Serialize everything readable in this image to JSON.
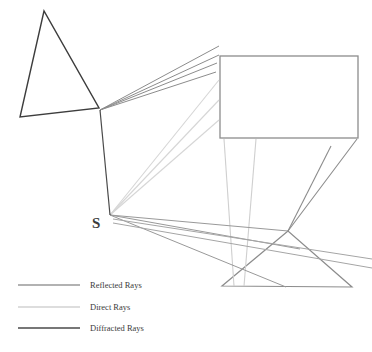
{
  "figure": {
    "type": "ray-propagation-diagram",
    "background": "#ffffff",
    "width": 372,
    "height": 352
  },
  "colors": {
    "reflected": "#8c8c8c",
    "direct": "#d6d6d6",
    "diffracted": "#4a4a4a",
    "obstacle_dark": "#3d3d3d",
    "obstacle_gray": "#8c8c8c",
    "label_text": "#3a3a3a"
  },
  "source": {
    "label": "S",
    "x": 110,
    "y": 215,
    "label_x": 92,
    "label_y": 228
  },
  "obstacles": [
    {
      "name": "left-triangle",
      "shape": "triangle",
      "stroke": "#3d3d3d",
      "stroke_width": 1.4,
      "points": "44,11 20,117 99,108"
    },
    {
      "name": "right-rectangle",
      "shape": "rectangle",
      "stroke": "#8c8c8c",
      "stroke_width": 1.3,
      "x": 220,
      "y": 56,
      "width": 138,
      "height": 82
    },
    {
      "name": "bottom-triangle",
      "shape": "triangle",
      "stroke": "#8c8c8c",
      "stroke_width": 1.2,
      "points": "288,231 222,286 352,287"
    }
  ],
  "ray_groups": [
    {
      "name": "diffracted-source-to-edge",
      "category": "diffracted",
      "stroke": "#4a4a4a",
      "stroke_width": 1.2,
      "segments": [
        {
          "x1": 110,
          "y1": 215,
          "x2": 100,
          "y2": 110
        }
      ]
    },
    {
      "name": "reflected-fan-upper-right",
      "category": "reflected",
      "stroke": "#8c8c8c",
      "stroke_width": 1.0,
      "segments": [
        {
          "x1": 100,
          "y1": 110,
          "x2": 219,
          "y2": 46
        },
        {
          "x1": 100,
          "y1": 110,
          "x2": 219,
          "y2": 55
        },
        {
          "x1": 100,
          "y1": 110,
          "x2": 217,
          "y2": 63
        },
        {
          "x1": 100,
          "y1": 110,
          "x2": 216,
          "y2": 72
        }
      ]
    },
    {
      "name": "direct-fan-to-rectangle",
      "category": "direct",
      "stroke": "#d6d6d6",
      "stroke_width": 1.1,
      "segments": [
        {
          "x1": 110,
          "y1": 215,
          "x2": 219,
          "y2": 80
        },
        {
          "x1": 110,
          "y1": 215,
          "x2": 219,
          "y2": 100
        },
        {
          "x1": 110,
          "y1": 215,
          "x2": 219,
          "y2": 120
        }
      ]
    },
    {
      "name": "direct-verticals-below-rectangle",
      "category": "direct",
      "stroke": "#cfcfcf",
      "stroke_width": 1.1,
      "segments": [
        {
          "x1": 224,
          "y1": 139,
          "x2": 234,
          "y2": 286
        },
        {
          "x1": 256,
          "y1": 139,
          "x2": 244,
          "y2": 286
        }
      ]
    },
    {
      "name": "reflected-fan-lower-right",
      "category": "reflected",
      "stroke": "#999999",
      "stroke_width": 1.0,
      "segments": [
        {
          "x1": 110,
          "y1": 215,
          "x2": 288,
          "y2": 231
        },
        {
          "x1": 110,
          "y1": 215,
          "x2": 300,
          "y2": 249
        },
        {
          "x1": 110,
          "y1": 215,
          "x2": 286,
          "y2": 287
        }
      ]
    },
    {
      "name": "reflected-apex-to-rectangle",
      "category": "reflected",
      "stroke": "#8c8c8c",
      "stroke_width": 1.1,
      "segments": [
        {
          "x1": 288,
          "y1": 231,
          "x2": 331,
          "y2": 146
        },
        {
          "x1": 288,
          "y1": 231,
          "x2": 357,
          "y2": 139
        }
      ]
    },
    {
      "name": "reflected-ground-lines",
      "category": "reflected",
      "stroke": "#a5a5a5",
      "stroke_width": 1.0,
      "segments": [
        {
          "x1": 113,
          "y1": 219,
          "x2": 372,
          "y2": 259
        },
        {
          "x1": 113,
          "y1": 223,
          "x2": 372,
          "y2": 268
        }
      ]
    }
  ],
  "legend": {
    "items": [
      {
        "label": "Reflected Rays",
        "color": "#999999",
        "width": 1.3,
        "y": 285
      },
      {
        "label": "Direct Rays",
        "color": "#d2d2d2",
        "width": 1.3,
        "y": 307
      },
      {
        "label": "Diffracted Rays",
        "color": "#4a4a4a",
        "width": 1.6,
        "y": 328
      }
    ],
    "line_x1": 18,
    "line_x2": 80,
    "text_x": 90
  }
}
